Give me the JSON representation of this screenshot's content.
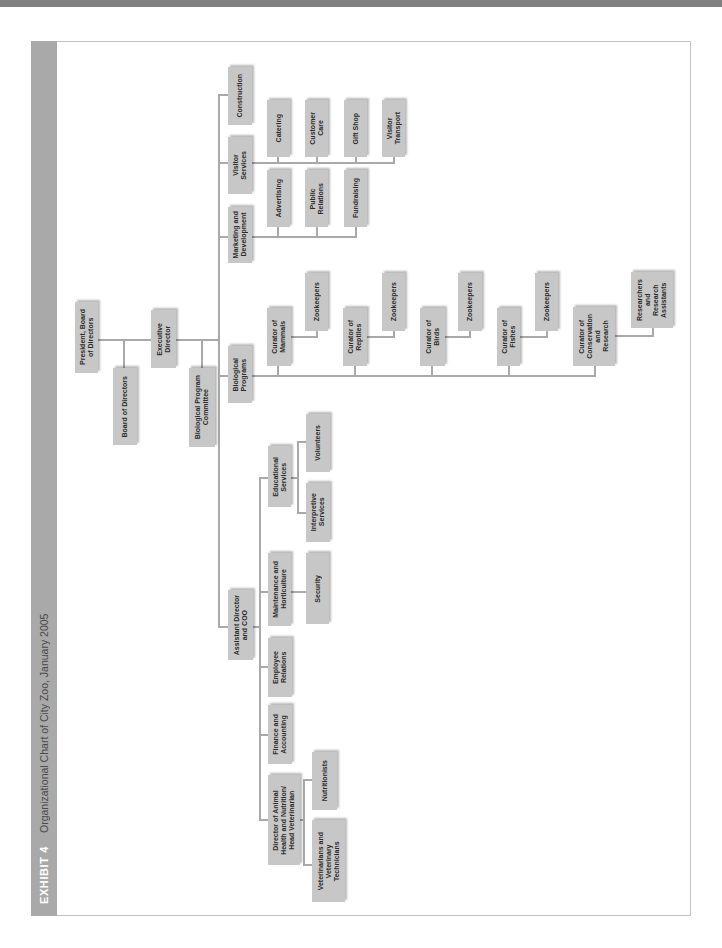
{
  "exhibit": {
    "label": "EXHIBIT 4",
    "title": "Organizational Chart of City Zoo, January 2005"
  },
  "colors": {
    "top_strip": "#808080",
    "title_bar": "#a9a9a9",
    "box_fill": "#c7c7c7",
    "connector": "#a9a9a9"
  },
  "org_chart": {
    "nodes": [
      {
        "id": "president",
        "label": "President, Board\nof Directors",
        "parent": null
      },
      {
        "id": "board",
        "label": "Board of Directors",
        "parent": "president"
      },
      {
        "id": "executive",
        "label": "Executive\nDirector",
        "parent": "president"
      },
      {
        "id": "bio-committee",
        "label": "Biological Program\nCommittee",
        "parent": "executive"
      },
      {
        "id": "construction",
        "label": "Construction",
        "parent": "executive"
      },
      {
        "id": "visitor-services",
        "label": "Visitor\nServices",
        "parent": "executive"
      },
      {
        "id": "marketing",
        "label": "Marketing and\nDevelopment",
        "parent": "executive"
      },
      {
        "id": "bio-programs",
        "label": "Biological\nPrograms",
        "parent": "executive"
      },
      {
        "id": "assistant-director",
        "label": "Assistant Director\nand COO",
        "parent": "executive"
      },
      {
        "id": "catering",
        "label": "Catering",
        "parent": "visitor-services"
      },
      {
        "id": "customer-care",
        "label": "Customer\nCare",
        "parent": "visitor-services"
      },
      {
        "id": "gift-shop",
        "label": "Gift Shop",
        "parent": "visitor-services"
      },
      {
        "id": "visitor-transport",
        "label": "Visitor\nTransport",
        "parent": "visitor-services"
      },
      {
        "id": "advertising",
        "label": "Advertising",
        "parent": "marketing"
      },
      {
        "id": "public-relations",
        "label": "Public\nRelations",
        "parent": "marketing"
      },
      {
        "id": "fundraising",
        "label": "Fundraising",
        "parent": "marketing"
      },
      {
        "id": "curator-mammals",
        "label": "Curator of\nMammals",
        "parent": "bio-programs"
      },
      {
        "id": "zookeepers-mammals",
        "label": "Zookeepers",
        "parent": "curator-mammals"
      },
      {
        "id": "curator-reptiles",
        "label": "Curator of\nReptiles",
        "parent": "bio-programs"
      },
      {
        "id": "zookeepers-reptiles",
        "label": "Zookeepers",
        "parent": "curator-reptiles"
      },
      {
        "id": "curator-birds",
        "label": "Curator of\nBirds",
        "parent": "bio-programs"
      },
      {
        "id": "zookeepers-birds",
        "label": "Zookeepers",
        "parent": "curator-birds"
      },
      {
        "id": "curator-fishes",
        "label": "Curator of\nFishes",
        "parent": "bio-programs"
      },
      {
        "id": "zookeepers-fishes",
        "label": "Zookeepers",
        "parent": "curator-fishes"
      },
      {
        "id": "curator-conservation",
        "label": "Curator of\nConservation\nand\nResearch",
        "parent": "bio-programs"
      },
      {
        "id": "researchers",
        "label": "Researchers\nand\nResearch\nAssistants",
        "parent": "curator-conservation"
      },
      {
        "id": "educational-services",
        "label": "Educational\nServices",
        "parent": "assistant-director"
      },
      {
        "id": "volunteers",
        "label": "Volunteers",
        "parent": "educational-services"
      },
      {
        "id": "interpretive-services",
        "label": "Interpretive\nServices",
        "parent": "educational-services"
      },
      {
        "id": "maintenance",
        "label": "Maintenance and\nHorticulture",
        "parent": "assistant-director"
      },
      {
        "id": "security",
        "label": "Security",
        "parent": "maintenance"
      },
      {
        "id": "employee-relations",
        "label": "Employee\nRelations",
        "parent": "assistant-director"
      },
      {
        "id": "finance",
        "label": "Finance and\nAccounting",
        "parent": "assistant-director"
      },
      {
        "id": "director-animal-health",
        "label": "Director of Animal\nHealth and Nutrition/\nHead Veterinarian",
        "parent": "assistant-director"
      },
      {
        "id": "nutritionists",
        "label": "Nutritionists",
        "parent": "director-animal-health"
      },
      {
        "id": "veterinarians",
        "label": "Veterinarians and\nVeterinary\nTechnicians",
        "parent": "director-animal-health"
      }
    ]
  }
}
